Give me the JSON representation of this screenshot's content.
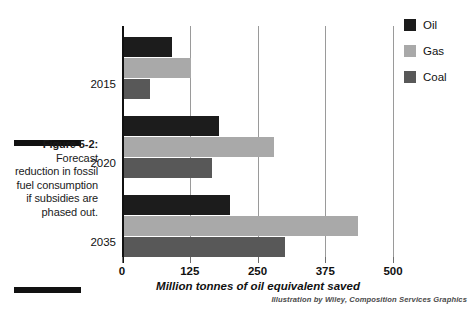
{
  "figure": {
    "caption_label": "Figure 5-2:",
    "caption_body": "Forecast reduction in fossil fuel consumption if subsidies are phased out.",
    "attribution": "Illustration by Wiley, Composition Services Graphics"
  },
  "legend": {
    "items": [
      {
        "label": "Oil",
        "color": "#1c1c1c"
      },
      {
        "label": "Gas",
        "color": "#a9a9a9"
      },
      {
        "label": "Coal",
        "color": "#585858"
      }
    ]
  },
  "axis": {
    "tick_labels": [
      "0",
      "125",
      "250",
      "375",
      "500"
    ],
    "title": "Million tonnes of oil equivalent saved"
  },
  "categories": [
    "2015",
    "2020",
    "2035"
  ],
  "chart_data": {
    "type": "bar",
    "orientation": "horizontal",
    "title": "Forecast reduction in fossil fuel consumption if subsidies are phased out",
    "xlabel": "Million tonnes of oil equivalent saved",
    "ylabel": "",
    "categories": [
      "2015",
      "2020",
      "2035"
    ],
    "series": [
      {
        "name": "Oil",
        "color": "#1c1c1c",
        "values": [
          90,
          177,
          197
        ]
      },
      {
        "name": "Gas",
        "color": "#a9a9a9",
        "values": [
          125,
          278,
          433
        ]
      },
      {
        "name": "Coal",
        "color": "#585858",
        "values": [
          48,
          164,
          297
        ]
      }
    ],
    "xlim": [
      0,
      500
    ],
    "xticks": [
      0,
      125,
      250,
      375,
      500
    ],
    "grid": "vertical",
    "legend_position": "right"
  }
}
